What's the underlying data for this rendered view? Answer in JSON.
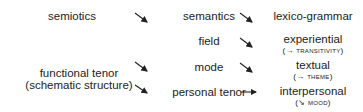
{
  "left": {
    "semiotics": "semiotics",
    "functional_tenor": "functional tenor",
    "schematic_structure": "(schematic structure)"
  },
  "middle": {
    "semantics": "semantics",
    "field": "field",
    "mode": "mode",
    "personal_tenor": "personal tenor"
  },
  "right": {
    "lexico_grammar": "lexico-grammar",
    "experiential": "experiential",
    "experiential_sub_prefix": "(→ ",
    "experiential_sub_term": "transitivity",
    "experiential_sub_suffix": ")",
    "textual": "textual",
    "textual_sub_prefix": "(→ ",
    "textual_sub_term": "theme",
    "textual_sub_suffix": ")",
    "interpersonal": "interpersonal",
    "interpersonal_sub_prefix": "(↘ ",
    "interpersonal_sub_term": "mood",
    "interpersonal_sub_suffix": ")"
  },
  "arrows": [
    {
      "from": "semiotics",
      "to": "semantics",
      "direction": "diagonal"
    },
    {
      "from": "semantics",
      "to": "lexico-grammar",
      "direction": "diagonal"
    },
    {
      "from": "field",
      "to": "experiential",
      "direction": "diagonal"
    },
    {
      "from": "functional tenor",
      "to": "mode",
      "direction": "diagonal"
    },
    {
      "from": "mode",
      "to": "textual",
      "direction": "diagonal"
    },
    {
      "from": "functional tenor",
      "to": "personal tenor",
      "direction": "diagonal"
    },
    {
      "from": "personal tenor",
      "to": "interpersonal",
      "direction": "horizontal"
    }
  ]
}
